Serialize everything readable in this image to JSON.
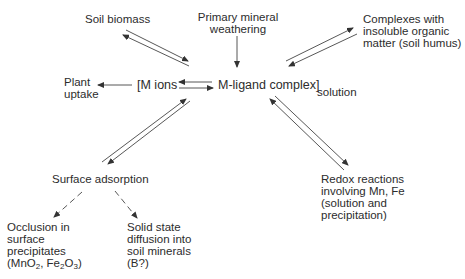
{
  "diagram": {
    "title": "",
    "nodes": {
      "soil_biomass": {
        "label": "Soil biomass"
      },
      "primary_mineral": {
        "line1": "Primary mineral",
        "line2": "weathering"
      },
      "complexes": {
        "line1": "Complexes with",
        "line2": "insoluble organic",
        "line3": "matter (soil humus)"
      },
      "plant_uptake": {
        "line1": "Plant",
        "line2": "uptake"
      },
      "m_ions": {
        "label": "[M ions"
      },
      "m_ligand": {
        "label": "M-ligand complex]"
      },
      "solution": {
        "label": "solution"
      },
      "surface_adsorption": {
        "label": "Surface adsorption"
      },
      "redox": {
        "line1": "Redox reactions",
        "line2": "involving Mn, Fe",
        "line3": "(solution and",
        "line4": "precipitation)"
      },
      "occlusion": {
        "line1": "Occlusion in",
        "line2": "surface",
        "line3": "precipitates",
        "line4_a": "(MnO",
        "line4_sub1": "2",
        "line4_b": ", Fe",
        "line4_sub2": "2",
        "line4_c": "O",
        "line4_sub3": "3",
        "line4_d": ")"
      },
      "solid_state": {
        "line1": "Solid state",
        "line2": "diffusion into",
        "line3": "soil minerals",
        "line4": "(B?)"
      }
    },
    "edges": [
      {
        "from": "soil_biomass",
        "to": "solution_pool",
        "type": "reversible"
      },
      {
        "from": "primary_mineral",
        "to": "m_ligand",
        "type": "one-way"
      },
      {
        "from": "complexes",
        "to": "solution_pool",
        "type": "reversible"
      },
      {
        "from": "m_ions",
        "to": "plant_uptake",
        "type": "one-way"
      },
      {
        "from": "m_ions",
        "to": "m_ligand",
        "type": "reversible"
      },
      {
        "from": "surface_adsorption",
        "to": "solution_pool",
        "type": "reversible"
      },
      {
        "from": "redox",
        "to": "solution_pool",
        "type": "reversible"
      },
      {
        "from": "surface_adsorption",
        "to": "occlusion",
        "type": "dashed"
      },
      {
        "from": "surface_adsorption",
        "to": "solid_state",
        "type": "dashed"
      }
    ],
    "colors": {
      "line": "#333333",
      "text": "#2c2c2c",
      "background": "#ffffff"
    }
  }
}
